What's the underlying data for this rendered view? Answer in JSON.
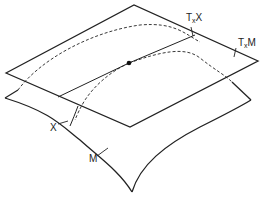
{
  "diagram": {
    "labels": {
      "tangent_space_X": {
        "main": "T",
        "sub": "x",
        "suffix": "X"
      },
      "tangent_space_M": {
        "main": "T",
        "sub": "x",
        "suffix": "M"
      },
      "submanifold": "X",
      "manifold": "M"
    },
    "colors": {
      "stroke": "#222222",
      "background": "#ffffff"
    }
  }
}
